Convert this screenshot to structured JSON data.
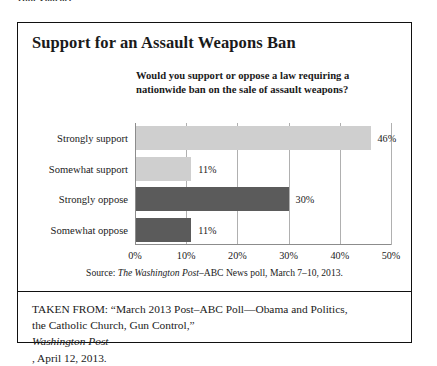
{
  "running_header": "Gun Violence",
  "figure": {
    "title": "Support for an Assault Weapons Ban",
    "question_line1": "Would you support or oppose a law requiring a",
    "question_line2": "nationwide ban on the sale of assault weapons?",
    "source_prefix": "Source: ",
    "source_italic": "The Washington Post",
    "source_suffix": "–ABC News poll, March 7–10, 2013.",
    "caption_line1_pre": "TAKEN FROM: “March 2013 Post–ABC Poll—Obama and Politics,",
    "caption_line2_pre": "the Catholic Church, Gun Control,” ",
    "caption_line2_italic": "Washington Post",
    "caption_line2_post": ", April 12, 2013."
  },
  "chart_data": {
    "type": "bar",
    "orientation": "horizontal",
    "title": "Support for an Assault Weapons Ban",
    "subtitle": "Would you support or oppose a law requiring a nationwide ban on the sale of assault weapons?",
    "xlabel": "",
    "ylabel": "",
    "xlim": [
      0,
      50
    ],
    "grid": true,
    "legend": "none",
    "categories": [
      "Strongly support",
      "Somewhat support",
      "Strongly oppose",
      "Somewhat oppose"
    ],
    "values": [
      46,
      11,
      30,
      11
    ],
    "value_labels": [
      "46%",
      "11%",
      "30%",
      "11%"
    ],
    "bar_colors": [
      "#cfcfcf",
      "#cfcfcf",
      "#5b5b5b",
      "#5b5b5b"
    ],
    "tick_values": [
      0,
      10,
      20,
      30,
      40,
      50
    ],
    "tick_labels": [
      "0%",
      "10%",
      "20%",
      "30%",
      "40%",
      "50%"
    ],
    "source": "Source: The Washington Post–ABC News poll, March 7–10, 2013."
  },
  "colors": {
    "support_bar": "#cfcfcf",
    "oppose_bar": "#5b5b5b",
    "frame": "#111111",
    "gridline": "#b0b0b0",
    "axis": "#8c8c8c",
    "background": "#ffffff"
  }
}
